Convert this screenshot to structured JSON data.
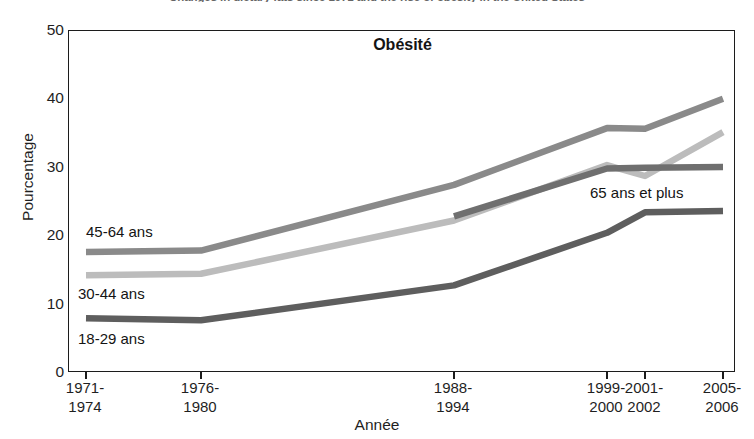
{
  "caption": "Changes in dietary fats since 1971 and the rise of obesity in the United States",
  "chart": {
    "title": "Obésité",
    "xlabel": "Année",
    "ylabel": "Pourcentage"
  },
  "chart_data": {
    "type": "line",
    "title": "Obésité",
    "xlabel": "Année",
    "ylabel": "Pourcentage",
    "ylim": [
      0,
      50
    ],
    "yticks": [
      50,
      40,
      30,
      20,
      10,
      0
    ],
    "grid": false,
    "legend": "inline-labels",
    "categories": [
      "1971-1974",
      "1976-1980",
      "1988-1994",
      "1999-2000",
      "2001-2002",
      "2005-2006"
    ],
    "category_positions_px": [
      85,
      200,
      453,
      606,
      644,
      722
    ],
    "series": [
      {
        "name": "18-29 ans",
        "color": "#5e5e5e",
        "label_x": 78,
        "label_y": 330,
        "values": [
          8.0,
          7.7,
          12.8,
          20.5,
          23.5,
          23.7
        ]
      },
      {
        "name": "30-44 ans",
        "color": "#bcbcbc",
        "label_x": 78,
        "label_y": 285,
        "values": [
          14.3,
          14.5,
          22.3,
          30.4,
          28.8,
          35.2
        ]
      },
      {
        "name": "45-64 ans",
        "color": "#8a8a8a",
        "label_x": 86,
        "label_y": 223,
        "values": [
          17.7,
          17.9,
          27.5,
          35.8,
          35.7,
          40.1
        ]
      },
      {
        "name": "65 ans et plus",
        "color": "#6f6f6f",
        "label_x": 590,
        "label_y": 184,
        "starts_at_category": "1988-1994",
        "values": [
          null,
          null,
          22.9,
          29.9,
          30.0,
          30.1
        ]
      }
    ]
  }
}
